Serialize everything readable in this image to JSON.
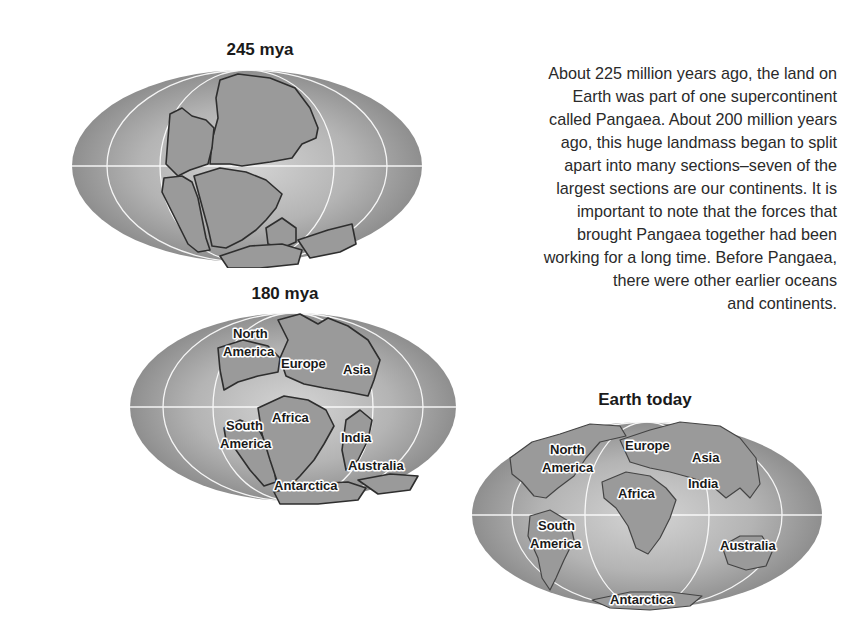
{
  "maps": [
    {
      "title": "245 mya",
      "labels": []
    },
    {
      "title": "180 mya",
      "labels": [
        "North",
        "America",
        "Europe",
        "Asia",
        "Africa",
        "South",
        "America",
        "India",
        "Australia",
        "Antarctica"
      ]
    },
    {
      "title": "Earth today",
      "labels": [
        "North",
        "America",
        "Europe",
        "Asia",
        "Africa",
        "India",
        "South",
        "America",
        "Australia",
        "Antarctica"
      ]
    }
  ],
  "description": {
    "lines": [
      "About 225 million years ago, the land on",
      "Earth was part of one supercontinent",
      "called Pangaea. About 200 million years",
      "ago, this huge landmass began to split",
      "apart into many sections–seven of the",
      "largest sections are our continents. It is",
      "important to note that the forces that",
      "brought Pangaea together had been",
      "working for a long time. Before Pangaea,",
      "there were other earlier oceans",
      "and continents."
    ]
  },
  "colors": {
    "ocean_dark": "#8c8c8c",
    "ocean_light": "#cfcfcf",
    "land": "#9a9a9a",
    "outline": "#2e2e2e"
  }
}
